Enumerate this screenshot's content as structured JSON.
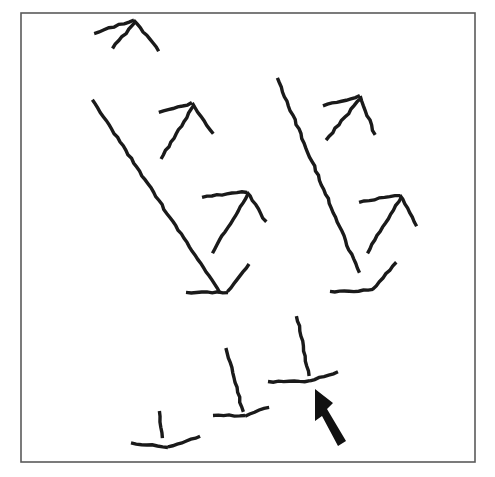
{
  "figure": {
    "canvas": {
      "width": 495,
      "height": 477,
      "background": "#ffffff"
    },
    "frame": {
      "name": "stimulus-border",
      "x": 21,
      "y": 13,
      "width": 454,
      "height": 449,
      "stroke_color": "#5a5a5a",
      "stroke_width": 1.6
    },
    "ink_color": "#1a1a1a",
    "stroke_width": 3.4,
    "thin_stroke_width": 3.0,
    "shapes": [
      {
        "id": "shape-1",
        "label": "arrow-head-top-left",
        "group": "upper-row",
        "strokes": [
          {
            "name": "left-arm",
            "points": [
              [
                94,
                33
              ],
              [
                134,
                20
              ]
            ]
          },
          {
            "name": "right-arm",
            "points": [
              [
                134,
                20
              ],
              [
                159,
                51
              ]
            ]
          },
          {
            "name": "inner-stem",
            "points": [
              [
                112,
                48
              ],
              [
                136,
                22
              ]
            ]
          }
        ]
      },
      {
        "id": "shape-2",
        "label": "long-diagonal-left",
        "group": "middle-row",
        "strokes": [
          {
            "name": "diagonal-line",
            "points": [
              [
                92,
                100
              ],
              [
                220,
                293
              ]
            ]
          }
        ]
      },
      {
        "id": "shape-3",
        "label": "arrow-head-middle-upper-left",
        "group": "middle-row",
        "strokes": [
          {
            "name": "left-arm",
            "points": [
              [
                159,
                113
              ],
              [
                192,
                103
              ]
            ]
          },
          {
            "name": "right-arm",
            "points": [
              [
                192,
                103
              ],
              [
                213,
                134
              ]
            ]
          },
          {
            "name": "inner-stem",
            "points": [
              [
                161,
                159
              ],
              [
                194,
                105
              ]
            ]
          }
        ]
      },
      {
        "id": "shape-4",
        "label": "arrow-head-middle-lower-left",
        "group": "middle-row",
        "strokes": [
          {
            "name": "left-arm",
            "points": [
              [
                202,
                197
              ],
              [
                247,
                192
              ]
            ]
          },
          {
            "name": "right-arm",
            "points": [
              [
                247,
                192
              ],
              [
                266,
                222
              ]
            ]
          },
          {
            "name": "inner-stem",
            "points": [
              [
                212,
                253
              ],
              [
                248,
                194
              ]
            ]
          }
        ]
      },
      {
        "id": "shape-5",
        "label": "v-foot-left",
        "group": "middle-row",
        "strokes": [
          {
            "name": "base-horizontal",
            "points": [
              [
                186,
                293
              ],
              [
                228,
                292
              ]
            ]
          },
          {
            "name": "rising-arm",
            "points": [
              [
                228,
                292
              ],
              [
                249,
                264
              ]
            ]
          }
        ]
      },
      {
        "id": "shape-6",
        "label": "long-diagonal-right",
        "group": "middle-row",
        "strokes": [
          {
            "name": "diagonal-line",
            "points": [
              [
                277,
                78
              ],
              [
                359,
                273
              ]
            ]
          }
        ]
      },
      {
        "id": "shape-7",
        "label": "arrow-head-middle-upper-right",
        "group": "middle-row",
        "strokes": [
          {
            "name": "left-arm",
            "points": [
              [
                323,
                106
              ],
              [
                360,
                96
              ]
            ]
          },
          {
            "name": "right-arm",
            "points": [
              [
                360,
                96
              ],
              [
                375,
                135
              ]
            ]
          },
          {
            "name": "inner-stem",
            "points": [
              [
                326,
                140
              ],
              [
                361,
                98
              ]
            ]
          }
        ]
      },
      {
        "id": "shape-8",
        "label": "arrow-head-middle-lower-right",
        "group": "middle-row",
        "strokes": [
          {
            "name": "left-arm",
            "points": [
              [
                359,
                202
              ],
              [
                400,
                195
              ]
            ]
          },
          {
            "name": "right-arm",
            "points": [
              [
                400,
                195
              ],
              [
                417,
                226
              ]
            ]
          },
          {
            "name": "inner-stem",
            "points": [
              [
                367,
                253
              ],
              [
                401,
                197
              ]
            ]
          }
        ]
      },
      {
        "id": "shape-9",
        "label": "v-foot-right",
        "group": "middle-row",
        "strokes": [
          {
            "name": "base-horizontal",
            "points": [
              [
                330,
                292
              ],
              [
                373,
                290
              ]
            ]
          },
          {
            "name": "rising-arm",
            "points": [
              [
                373,
                290
              ],
              [
                396,
                262
              ]
            ]
          }
        ]
      },
      {
        "id": "shape-10",
        "label": "stem-foot-bottom-left",
        "group": "lower-row",
        "strokes": [
          {
            "name": "vertical-stem",
            "points": [
              [
                159,
                411
              ],
              [
                163,
                438
              ]
            ]
          },
          {
            "name": "base-left",
            "points": [
              [
                131,
                443
              ],
              [
                168,
                447
              ]
            ]
          },
          {
            "name": "base-right-rising",
            "points": [
              [
                168,
                447
              ],
              [
                200,
                436
              ]
            ]
          }
        ]
      },
      {
        "id": "shape-11",
        "label": "stem-foot-bottom-middle",
        "group": "lower-row",
        "strokes": [
          {
            "name": "vertical-stem",
            "points": [
              [
                226,
                348
              ],
              [
                243,
                412
              ]
            ]
          },
          {
            "name": "base-left",
            "points": [
              [
                213,
                415
              ],
              [
                245,
                416
              ]
            ]
          },
          {
            "name": "base-right-rising",
            "points": [
              [
                245,
                416
              ],
              [
                269,
                407
              ]
            ]
          }
        ]
      },
      {
        "id": "shape-12",
        "label": "stem-foot-bottom-right-target",
        "group": "lower-row",
        "strokes": [
          {
            "name": "vertical-stem",
            "points": [
              [
                297,
                316
              ],
              [
                309,
                376
              ]
            ]
          },
          {
            "name": "base-left",
            "points": [
              [
                268,
                382
              ],
              [
                310,
                381
              ]
            ]
          },
          {
            "name": "base-right-rising",
            "points": [
              [
                310,
                381
              ],
              [
                338,
                372
              ]
            ]
          }
        ]
      }
    ],
    "pointer": {
      "name": "mouse-cursor-arrow",
      "label": "pointer-arrow",
      "tip": [
        315,
        389
      ],
      "tail": [
        346,
        441
      ],
      "color": "#111111",
      "polygon": "315,389 333,403 327,409 346,441 338,446 322,416 315,421"
    }
  }
}
